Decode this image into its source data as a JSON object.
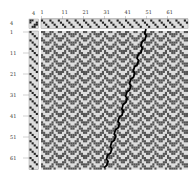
{
  "top_axis": {
    "corner_label": "4",
    "labels": [
      "1",
      "11",
      "21",
      "31",
      "41",
      "51",
      "61"
    ]
  },
  "left_axis": {
    "corner_label": "4",
    "labels": [
      "1",
      "11",
      "21",
      "31",
      "41",
      "51",
      "61"
    ]
  },
  "grid": {
    "ends": 70,
    "picks": 66,
    "shafts": 4,
    "treadles": 4
  },
  "colors": {
    "background": "#ffffff",
    "cell_dark": "#555555",
    "cell_light": "#dddddd",
    "threading_dark": "#222222",
    "line": "#000000",
    "frame": "#888888"
  },
  "highlight_line": {
    "description": "black stepped diagonal through drawdown",
    "start_end": 50,
    "end_end": 30
  }
}
